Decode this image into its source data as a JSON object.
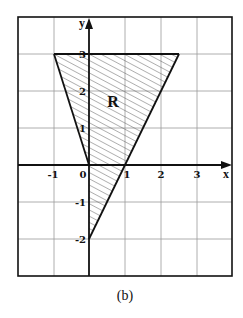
{
  "figure": {
    "caption": "(b)",
    "region_label": "R",
    "axes": {
      "x_name": "x",
      "y_name": "y",
      "x_range": [
        -2,
        4
      ],
      "y_range": [
        -3,
        4
      ],
      "x_tick_labels": [
        "-1",
        "0",
        "1",
        "2",
        "3"
      ],
      "y_tick_labels": [
        "3",
        "2",
        "1",
        "-1",
        "-2"
      ]
    },
    "region": {
      "vertices": [
        [
          -1,
          3
        ],
        [
          2.5,
          3
        ],
        [
          0,
          -2
        ],
        [
          0,
          0
        ]
      ],
      "boundaries": [
        "y = 3",
        "y = -3x",
        "y = 2x - 2",
        "x = 0"
      ],
      "hatch": true
    },
    "colors": {
      "line": "#111111",
      "grid": "#9a9a9a",
      "hatch": "#555555",
      "background": "#ffffff"
    }
  }
}
